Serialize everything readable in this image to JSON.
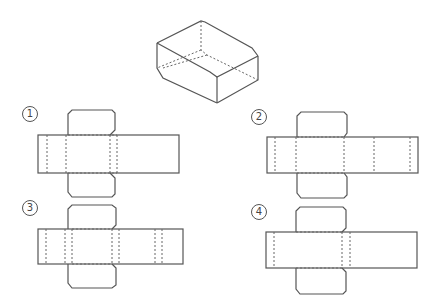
{
  "figure": {
    "box": {
      "label": "3D box"
    },
    "options": [
      {
        "id": 1,
        "label": "1",
        "symbol": "①"
      },
      {
        "id": 2,
        "label": "2",
        "symbol": "②"
      },
      {
        "id": 3,
        "label": "3",
        "symbol": "③"
      },
      {
        "id": 4,
        "label": "4",
        "symbol": "④"
      }
    ],
    "colors": {
      "line": "#555555",
      "background": "#ffffff"
    }
  }
}
